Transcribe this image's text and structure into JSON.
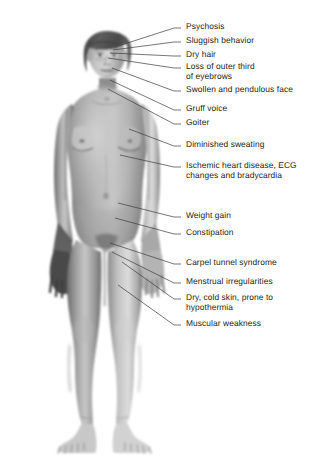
{
  "figure": {
    "background_color": "#ffffff",
    "text_color": "#231f20",
    "leader_line_color": "#3c3c3c"
  },
  "labels": [
    {
      "id": "psychosis",
      "text": "Psychosis",
      "text_x": 186,
      "text_y": 22,
      "tick_x": 174,
      "tick_y": 28,
      "anchor_x": 115,
      "anchor_y": 47
    },
    {
      "id": "sluggish-behavior",
      "text": "Sluggish behavior",
      "text_x": 186,
      "text_y": 36,
      "tick_x": 174,
      "tick_y": 42,
      "anchor_x": 113,
      "anchor_y": 50
    },
    {
      "id": "dry-hair",
      "text": "Dry hair",
      "text_x": 186,
      "text_y": 50,
      "tick_x": 174,
      "tick_y": 56,
      "anchor_x": 110,
      "anchor_y": 53
    },
    {
      "id": "loss-of-outer-third-of-eyebrows",
      "text": "Loss of outer third\nof eyebrows",
      "text_x": 186,
      "text_y": 62,
      "tick_x": 174,
      "tick_y": 68,
      "anchor_x": 108,
      "anchor_y": 58
    },
    {
      "id": "swollen-and-pendulous-face",
      "text": "Swollen and pendulous face",
      "text_x": 186,
      "text_y": 85,
      "tick_x": 174,
      "tick_y": 91,
      "anchor_x": 112,
      "anchor_y": 68
    },
    {
      "id": "gruff-voice",
      "text": "Gruff voice",
      "text_x": 186,
      "text_y": 104,
      "tick_x": 174,
      "tick_y": 110,
      "anchor_x": 110,
      "anchor_y": 80
    },
    {
      "id": "goiter",
      "text": "Goiter",
      "text_x": 186,
      "text_y": 118,
      "tick_x": 174,
      "tick_y": 124,
      "anchor_x": 108,
      "anchor_y": 89
    },
    {
      "id": "diminished-sweating",
      "text": "Diminished sweating",
      "text_x": 186,
      "text_y": 140,
      "tick_x": 174,
      "tick_y": 146,
      "anchor_x": 129,
      "anchor_y": 129
    },
    {
      "id": "ischemic-heart-disease",
      "text": "Ischemic heart disease, ECG\nchanges and bradycardia",
      "text_x": 186,
      "text_y": 161,
      "tick_x": 174,
      "tick_y": 167,
      "anchor_x": 120,
      "anchor_y": 155
    },
    {
      "id": "weight-gain",
      "text": "Weight gain",
      "text_x": 186,
      "text_y": 211,
      "tick_x": 174,
      "tick_y": 217,
      "anchor_x": 118,
      "anchor_y": 203
    },
    {
      "id": "constipation",
      "text": "Constipation",
      "text_x": 186,
      "text_y": 228,
      "tick_x": 174,
      "tick_y": 234,
      "anchor_x": 115,
      "anchor_y": 218
    },
    {
      "id": "carpel-tunnel-syndrome",
      "text": "Carpel tunnel syndrome",
      "text_x": 186,
      "text_y": 258,
      "tick_x": 174,
      "tick_y": 264,
      "anchor_x": 110,
      "anchor_y": 243
    },
    {
      "id": "menstrual-irregularities",
      "text": "Menstrual irregularities",
      "text_x": 186,
      "text_y": 277,
      "tick_x": 174,
      "tick_y": 283,
      "anchor_x": 112,
      "anchor_y": 252
    },
    {
      "id": "dry-cold-skin",
      "text": "Dry, cold skin, prone to\nhypothermia",
      "text_x": 186,
      "text_y": 293,
      "tick_x": 174,
      "tick_y": 299,
      "anchor_x": 122,
      "anchor_y": 262
    },
    {
      "id": "muscular-weakness",
      "text": "Muscular weakness",
      "text_x": 186,
      "text_y": 319,
      "tick_x": 174,
      "tick_y": 325,
      "anchor_x": 118,
      "anchor_y": 285
    }
  ]
}
